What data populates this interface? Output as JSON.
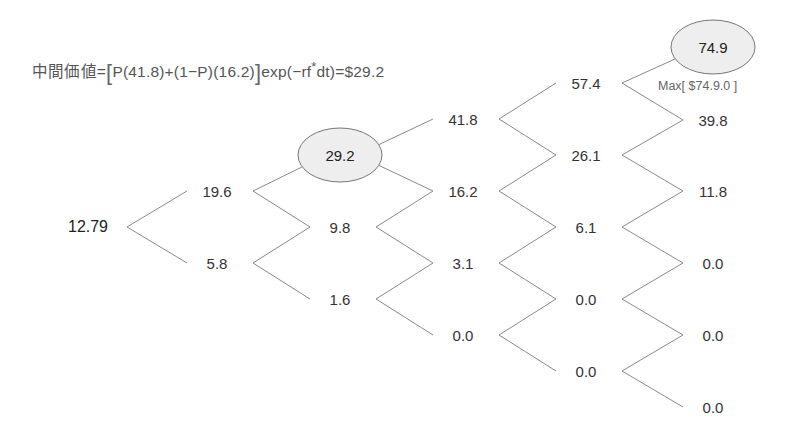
{
  "formula": {
    "label": "中間価値",
    "eq": "=",
    "lbracket": "[",
    "body": "P(41.8)+(1−P)(16.2)",
    "rbracket": "]",
    "tail_pre": "exp(−rf",
    "sup": "*",
    "tail_post": "dt)=$29.2"
  },
  "max_note": "Max[ $74.9.0 ]",
  "colors": {
    "line": "#8a8a8a",
    "ellipse_fill": "#eeeeee",
    "ellipse_stroke": "#777777",
    "text": "#333333"
  },
  "nodes": [
    {
      "id": "n0",
      "value": "12.79",
      "x": 88,
      "y": 227,
      "highlight": false
    },
    {
      "id": "n1u",
      "value": "19.6",
      "x": 217,
      "y": 191,
      "highlight": false
    },
    {
      "id": "n1d",
      "value": "5.8",
      "x": 217,
      "y": 263,
      "highlight": false
    },
    {
      "id": "n2a",
      "value": "29.2",
      "x": 340,
      "y": 155,
      "highlight": true
    },
    {
      "id": "n2b",
      "value": "9.8",
      "x": 340,
      "y": 227,
      "highlight": false
    },
    {
      "id": "n2c",
      "value": "1.6",
      "x": 340,
      "y": 299,
      "highlight": false
    },
    {
      "id": "n3a",
      "value": "41.8",
      "x": 463,
      "y": 119,
      "highlight": false
    },
    {
      "id": "n3b",
      "value": "16.2",
      "x": 463,
      "y": 191,
      "highlight": false
    },
    {
      "id": "n3c",
      "value": "3.1",
      "x": 463,
      "y": 263,
      "highlight": false
    },
    {
      "id": "n3d",
      "value": "0.0",
      "x": 463,
      "y": 335,
      "highlight": false
    },
    {
      "id": "n4a",
      "value": "57.4",
      "x": 586,
      "y": 83,
      "highlight": false
    },
    {
      "id": "n4b",
      "value": "26.1",
      "x": 586,
      "y": 155,
      "highlight": false
    },
    {
      "id": "n4c",
      "value": "6.1",
      "x": 586,
      "y": 227,
      "highlight": false
    },
    {
      "id": "n4d",
      "value": "0.0",
      "x": 586,
      "y": 299,
      "highlight": false
    },
    {
      "id": "n4e",
      "value": "0.0",
      "x": 586,
      "y": 371,
      "highlight": false
    },
    {
      "id": "n5a",
      "value": "74.9",
      "x": 713,
      "y": 47,
      "highlight": true
    },
    {
      "id": "n5b",
      "value": "39.8",
      "x": 713,
      "y": 120,
      "highlight": false
    },
    {
      "id": "n5c",
      "value": "11.8",
      "x": 713,
      "y": 191,
      "highlight": false
    },
    {
      "id": "n5d",
      "value": "0.0",
      "x": 713,
      "y": 263,
      "highlight": false
    },
    {
      "id": "n5e",
      "value": "0.0",
      "x": 713,
      "y": 335,
      "highlight": false
    },
    {
      "id": "n5f",
      "value": "0.0",
      "x": 713,
      "y": 407,
      "highlight": false
    }
  ]
}
